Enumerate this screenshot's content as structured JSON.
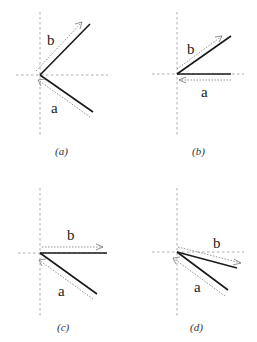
{
  "panels": [
    {
      "id": "a",
      "caption": "(a)",
      "vector_a_label": "a",
      "vector_b_label": "b",
      "description": "b points up-right, a points down-right; dotted arrows point toward/away from origin"
    },
    {
      "id": "b",
      "caption": "(b)",
      "vector_a_label": "a",
      "vector_b_label": "b",
      "description": "a horizontal to the right, b up-right"
    },
    {
      "id": "c",
      "caption": "(c)",
      "vector_a_label": "a",
      "vector_b_label": "b",
      "description": "b horizontal to the right, a down-right"
    },
    {
      "id": "d",
      "caption": "(d)",
      "vector_a_label": "a",
      "vector_b_label": "b",
      "description": "both a and b below horizontal, down-right"
    }
  ]
}
